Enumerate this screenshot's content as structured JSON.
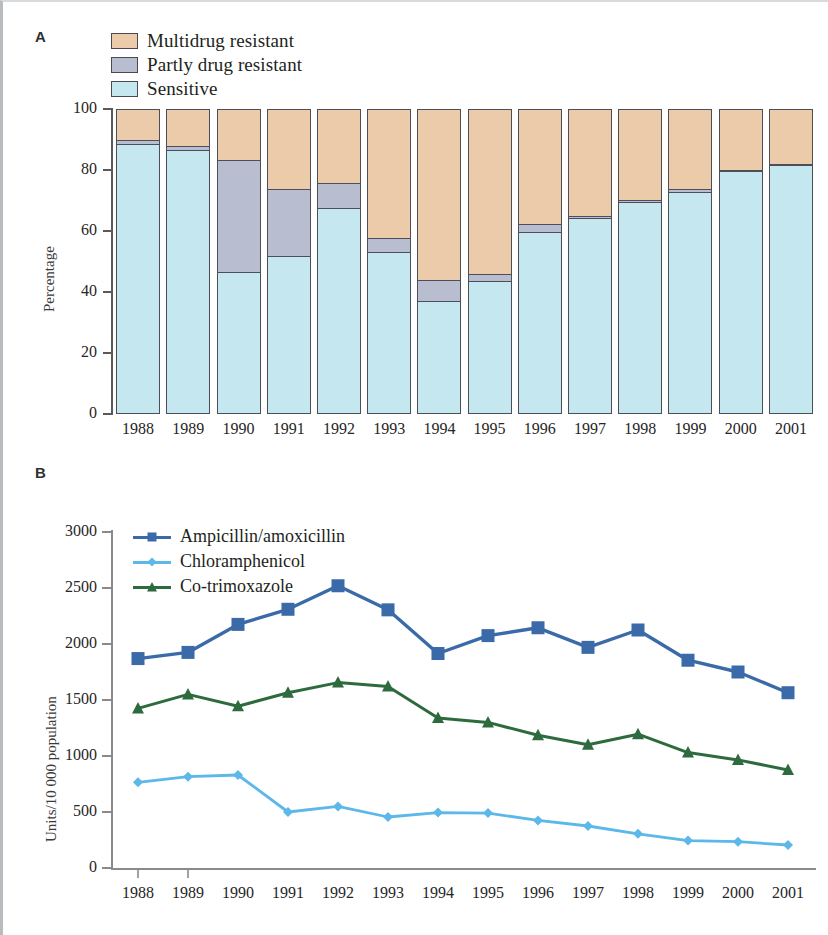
{
  "figure": {
    "panel_a_letter": "A",
    "panel_b_letter": "B"
  },
  "panelA": {
    "ylabel": "Percentage",
    "legend": [
      {
        "label": "Multidrug resistant",
        "color": "#ebcba9",
        "key": "multidrug_resistant"
      },
      {
        "label": "Partly drug resistant",
        "color": "#b8bdd0",
        "key": "partly_drug_resistant"
      },
      {
        "label": "Sensitive",
        "color": "#c5e7f0",
        "key": "sensitive"
      }
    ],
    "yticks": [
      "0",
      "20",
      "40",
      "60",
      "80",
      "100"
    ],
    "years": [
      "1988",
      "1989",
      "1990",
      "1991",
      "1992",
      "1993",
      "1994",
      "1995",
      "1996",
      "1997",
      "1998",
      "1999",
      "2000",
      "2001"
    ]
  },
  "panelB": {
    "ylabel": "Units/10 000 population",
    "yticks": [
      "0",
      "500",
      "1000",
      "1500",
      "2000",
      "2500",
      "3000"
    ],
    "legend": [
      {
        "label": "Ampicillin/amoxicillin",
        "color": "#3a6ba8",
        "marker": "square"
      },
      {
        "label": "Chloramphenicol",
        "color": "#5bb8e8",
        "marker": "diamond"
      },
      {
        "label": "Co-trimoxazole",
        "color": "#2d6b3f",
        "marker": "triangle"
      }
    ],
    "years": [
      "1988",
      "1989",
      "1990",
      "1991",
      "1992",
      "1993",
      "1994",
      "1995",
      "1996",
      "1997",
      "1998",
      "1999",
      "2000",
      "2001"
    ]
  },
  "chart_data": [
    {
      "type": "bar",
      "id": "panel-a-stacked-bar",
      "title": "",
      "panel": "A",
      "stacked": true,
      "normalized_to_percent": true,
      "xlabel": "",
      "ylabel": "Percentage",
      "ylim": [
        0,
        100
      ],
      "yticks": [
        0,
        20,
        40,
        60,
        80,
        100
      ],
      "grid": false,
      "legend_position": "top-left",
      "categories": [
        "1988",
        "1989",
        "1990",
        "1991",
        "1992",
        "1993",
        "1994",
        "1995",
        "1996",
        "1997",
        "1998",
        "1999",
        "2000",
        "2001"
      ],
      "series": [
        {
          "name": "Sensitive",
          "color": "#c5e7f0",
          "values": [
            88,
            86,
            46,
            51,
            67,
            52.5,
            36.5,
            43,
            59,
            63.5,
            69,
            72,
            79,
            81
          ]
        },
        {
          "name": "Partly drug resistant",
          "color": "#b8bdd0",
          "values": [
            1.5,
            1.5,
            37,
            22.5,
            8.5,
            5,
            7,
            2.5,
            3,
            1,
            0.8,
            1.5,
            0.8,
            0.5
          ]
        },
        {
          "name": "Multidrug resistant",
          "color": "#ebcba9",
          "values": [
            10.5,
            12.5,
            17,
            26.5,
            24.5,
            42.5,
            56.5,
            54.5,
            38,
            35.5,
            30.2,
            26.5,
            20.2,
            18.5
          ]
        }
      ],
      "cumulative_tops": {
        "sensitive": [
          88,
          86,
          46,
          51,
          67,
          52.5,
          36.5,
          43,
          59,
          63.5,
          69,
          72,
          79,
          81
        ],
        "plus_partly": [
          89.5,
          87.5,
          83,
          73.5,
          75.5,
          57.5,
          43.5,
          45.5,
          62,
          64.5,
          69.8,
          73.5,
          79.8,
          81.5
        ]
      }
    },
    {
      "type": "line",
      "id": "panel-b-line",
      "title": "",
      "panel": "B",
      "xlabel": "",
      "ylabel": "Units/10 000 population",
      "ylim": [
        0,
        3000
      ],
      "yticks": [
        0,
        500,
        1000,
        1500,
        2000,
        2500,
        3000
      ],
      "grid": false,
      "legend_position": "top-left",
      "x": [
        "1988",
        "1989",
        "1990",
        "1991",
        "1992",
        "1993",
        "1994",
        "1995",
        "1996",
        "1997",
        "1998",
        "1999",
        "2000",
        "2001"
      ],
      "series": [
        {
          "name": "Ampicillin/amoxicillin",
          "color": "#3a6ba8",
          "marker": "square",
          "values": [
            1870,
            1925,
            2175,
            2310,
            2520,
            2305,
            1915,
            2075,
            2145,
            1970,
            2125,
            1855,
            1750,
            1565
          ]
        },
        {
          "name": "Chloramphenicol",
          "color": "#5bb8e8",
          "marker": "diamond",
          "values": [
            765,
            815,
            830,
            500,
            550,
            455,
            495,
            490,
            425,
            375,
            305,
            245,
            235,
            205
          ]
        },
        {
          "name": "Co-trimoxazole",
          "color": "#2d6b3f",
          "marker": "triangle",
          "values": [
            1425,
            1550,
            1445,
            1565,
            1655,
            1620,
            1340,
            1300,
            1185,
            1100,
            1195,
            1030,
            965,
            875
          ]
        }
      ]
    }
  ]
}
